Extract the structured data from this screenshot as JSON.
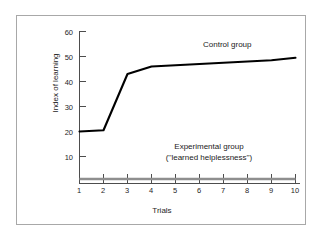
{
  "chart_data": {
    "type": "line",
    "title": "",
    "xlabel": "Trials",
    "ylabel": "Index of learning",
    "x": [
      1,
      2,
      3,
      4,
      5,
      6,
      7,
      8,
      9,
      10
    ],
    "xtick_labels": [
      "1",
      "2",
      "3",
      "4",
      "5",
      "6",
      "7",
      "8",
      "9",
      "10"
    ],
    "ytick_labels": [
      "60",
      "50",
      "40",
      "30",
      "20",
      "10"
    ],
    "ytick_values": [
      60,
      50,
      40,
      30,
      20,
      10
    ],
    "xlim": [
      1,
      10
    ],
    "ylim": [
      0,
      62
    ],
    "grid": false,
    "legend_position": "inline-annotation",
    "series": [
      {
        "name": "Control group",
        "values": [
          20,
          20.5,
          43,
          46,
          46.5,
          47,
          47.5,
          48,
          48.5,
          49.5
        ],
        "color": "#000000",
        "line_width": 2.1
      },
      {
        "name": "Experimental group (''learned helplessness'')",
        "values": [
          1,
          1,
          1,
          1,
          1,
          1,
          1,
          1,
          1,
          1
        ],
        "color": "#8f8f8f",
        "line_width": 2.6
      }
    ],
    "annotations": [
      {
        "id": "control-group-label",
        "text": "Control group"
      },
      {
        "id": "experimental-group-label",
        "line1": "Experimental group",
        "line2": "(''learned helplessness'')"
      }
    ]
  },
  "axes": {
    "y_axis_color": "#4d4d4d",
    "x_axis_color": "#4d4d4d"
  },
  "frame": {
    "border_color": "#a8a8a8",
    "background": "#ffffff"
  }
}
